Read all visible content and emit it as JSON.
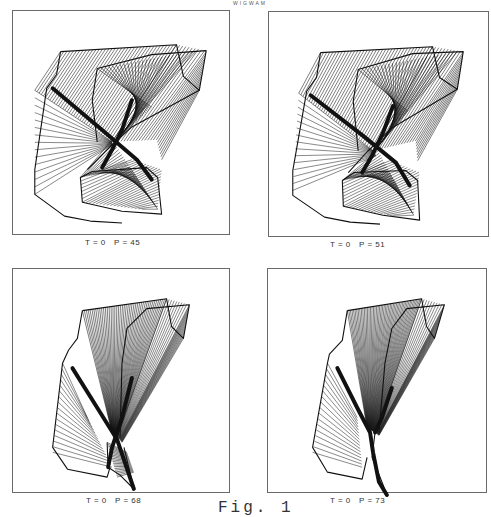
{
  "figure": {
    "header_text": "WIGWAM",
    "label": "Fig. 1",
    "line_color": "#111111",
    "frame_color": "#6a6a6a"
  },
  "panels": [
    {
      "id": "p45",
      "caption": "T = 0   P = 45",
      "T": 0,
      "P": 45,
      "box": {
        "x": 12,
        "y": 10,
        "w": 218,
        "h": 225
      },
      "caption_pos": {
        "x": 85,
        "y": 244
      },
      "surfaces": [
        {
          "a": [
            [
              48,
              41
            ],
            [
              165,
              34
            ]
          ],
          "b": [
            [
              22,
              80
            ],
            [
              100,
              132
            ]
          ],
          "n": 36,
          "w": 0.55
        },
        {
          "a": [
            [
              165,
              34
            ],
            [
              195,
              40
            ],
            [
              188,
              80
            ]
          ],
          "b": [
            [
              100,
              132
            ],
            [
              145,
              130
            ],
            [
              150,
              150
            ]
          ],
          "n": 22,
          "w": 0.55
        },
        {
          "a": [
            [
              85,
              58
            ],
            [
              185,
              40
            ]
          ],
          "b": [
            [
              140,
              97
            ],
            [
              100,
              135
            ]
          ],
          "n": 26,
          "w": 0.55
        },
        {
          "a": [
            [
              22,
              80
            ],
            [
              22,
              185
            ]
          ],
          "b": [
            [
              100,
              132
            ],
            [
              100,
              135
            ]
          ],
          "n": 14,
          "w": 0.5
        },
        {
          "a": [
            [
              68,
              168
            ],
            [
              118,
              158
            ]
          ],
          "b": [
            [
              100,
              130
            ],
            [
              146,
              200
            ]
          ],
          "n": 28,
          "w": 0.55
        },
        {
          "a": [
            [
              68,
              168
            ],
            [
              70,
              193
            ],
            [
              130,
              200
            ]
          ],
          "b": [
            [
              120,
              150
            ],
            [
              150,
              160
            ],
            [
              146,
              200
            ]
          ],
          "n": 24,
          "w": 0.5
        }
      ],
      "outlines": [
        [
          [
            48,
            41
          ],
          [
            165,
            34
          ],
          [
            172,
            66
          ],
          [
            188,
            80
          ],
          [
            195,
            40
          ],
          [
            140,
            44
          ],
          [
            85,
            58
          ],
          [
            80,
            90
          ],
          [
            85,
            132
          ]
        ],
        [
          [
            48,
            41
          ],
          [
            44,
            64
          ],
          [
            34,
            78
          ],
          [
            22,
            160
          ],
          [
            22,
            185
          ],
          [
            52,
            207
          ],
          [
            78,
            212
          ],
          [
            110,
            214
          ]
        ],
        [
          [
            68,
            168
          ],
          [
            80,
            162
          ],
          [
            135,
            158
          ],
          [
            146,
            168
          ],
          [
            150,
            205
          ],
          [
            110,
            202
          ],
          [
            70,
            193
          ],
          [
            68,
            168
          ]
        ],
        [
          [
            188,
            80
          ],
          [
            120,
            117
          ],
          [
            95,
            140
          ],
          [
            75,
            160
          ]
        ]
      ],
      "dark_strokes": [
        [
          [
            40,
            78
          ],
          [
            90,
            120
          ],
          [
            125,
            150
          ],
          [
            140,
            170
          ]
        ],
        [
          [
            120,
            90
          ],
          [
            110,
            120
          ],
          [
            100,
            140
          ],
          [
            90,
            158
          ]
        ]
      ]
    },
    {
      "id": "p51",
      "caption": "T = 0   P = 51",
      "T": 0,
      "P": 51,
      "box": {
        "x": 268,
        "y": 11,
        "w": 221,
        "h": 226
      },
      "caption_pos": {
        "x": 330,
        "y": 246
      },
      "surfaces": [
        {
          "a": [
            [
              52,
              41
            ],
            [
              165,
              35
            ]
          ],
          "b": [
            [
              30,
              82
            ],
            [
              105,
              140
            ]
          ],
          "n": 36,
          "w": 0.55
        },
        {
          "a": [
            [
              165,
              35
            ],
            [
              196,
              40
            ],
            [
              190,
              78
            ]
          ],
          "b": [
            [
              105,
              140
            ],
            [
              148,
              130
            ],
            [
              150,
              150
            ]
          ],
          "n": 22,
          "w": 0.55
        },
        {
          "a": [
            [
              90,
              58
            ],
            [
              190,
              40
            ]
          ],
          "b": [
            [
              140,
              100
            ],
            [
              105,
              142
            ]
          ],
          "n": 26,
          "w": 0.55
        },
        {
          "a": [
            [
              30,
              82
            ],
            [
              24,
              180
            ]
          ],
          "b": [
            [
              105,
              140
            ],
            [
              108,
              145
            ]
          ],
          "n": 14,
          "w": 0.5
        },
        {
          "a": [
            [
              74,
              170
            ],
            [
              120,
              160
            ]
          ],
          "b": [
            [
              110,
              140
            ],
            [
              146,
              205
            ]
          ],
          "n": 28,
          "w": 0.55
        },
        {
          "a": [
            [
              74,
              170
            ],
            [
              75,
              196
            ],
            [
              125,
              206
            ]
          ],
          "b": [
            [
              122,
              150
            ],
            [
              152,
              162
            ],
            [
              146,
              205
            ]
          ],
          "n": 24,
          "w": 0.5
        }
      ],
      "outlines": [
        [
          [
            52,
            41
          ],
          [
            165,
            35
          ],
          [
            172,
            66
          ],
          [
            190,
            78
          ],
          [
            196,
            40
          ],
          [
            145,
            42
          ],
          [
            90,
            58
          ],
          [
            85,
            90
          ],
          [
            90,
            140
          ]
        ],
        [
          [
            52,
            41
          ],
          [
            48,
            66
          ],
          [
            38,
            80
          ],
          [
            24,
            160
          ],
          [
            24,
            185
          ],
          [
            56,
            207
          ],
          [
            82,
            212
          ],
          [
            112,
            214
          ]
        ],
        [
          [
            74,
            170
          ],
          [
            86,
            162
          ],
          [
            138,
            160
          ],
          [
            150,
            170
          ],
          [
            152,
            210
          ],
          [
            115,
            205
          ],
          [
            75,
            196
          ],
          [
            74,
            170
          ]
        ],
        [
          [
            190,
            78
          ],
          [
            124,
            117
          ],
          [
            100,
            140
          ],
          [
            80,
            162
          ]
        ]
      ],
      "dark_strokes": [
        [
          [
            42,
            84
          ],
          [
            95,
            125
          ],
          [
            128,
            152
          ],
          [
            142,
            175
          ]
        ],
        [
          [
            125,
            95
          ],
          [
            115,
            122
          ],
          [
            104,
            145
          ],
          [
            94,
            162
          ]
        ]
      ]
    },
    {
      "id": "p68",
      "caption": "T = 0   P = 68",
      "T": 0,
      "P": 68,
      "box": {
        "x": 12,
        "y": 268,
        "w": 218,
        "h": 225
      },
      "caption_pos": {
        "x": 86,
        "y": 502
      },
      "surfaces": [
        {
          "a": [
            [
              70,
              42
            ],
            [
              155,
              30
            ]
          ],
          "b": [
            [
              100,
              165
            ],
            [
              105,
              170
            ]
          ],
          "n": 44,
          "w": 0.55
        },
        {
          "a": [
            [
              155,
              30
            ],
            [
              178,
              36
            ],
            [
              172,
              70
            ]
          ],
          "b": [
            [
              105,
              170
            ],
            [
              108,
              172
            ],
            [
              110,
              175
            ]
          ],
          "n": 22,
          "w": 0.5
        },
        {
          "a": [
            [
              50,
              95
            ],
            [
              40,
              185
            ]
          ],
          "b": [
            [
              75,
              150
            ],
            [
              100,
              200
            ]
          ],
          "n": 16,
          "w": 0.5
        },
        {
          "a": [
            [
              95,
              175
            ],
            [
              105,
              210
            ]
          ],
          "b": [
            [
              115,
              185
            ],
            [
              122,
              205
            ]
          ],
          "n": 20,
          "w": 0.55
        }
      ],
      "outlines": [
        [
          [
            70,
            42
          ],
          [
            155,
            30
          ],
          [
            160,
            58
          ],
          [
            172,
            70
          ],
          [
            178,
            36
          ],
          [
            135,
            40
          ],
          [
            115,
            60
          ],
          [
            110,
            95
          ],
          [
            108,
            170
          ]
        ],
        [
          [
            70,
            42
          ],
          [
            65,
            70
          ],
          [
            56,
            82
          ],
          [
            50,
            95
          ],
          [
            40,
            180
          ],
          [
            55,
            202
          ],
          [
            95,
            210
          ],
          [
            98,
            200
          ]
        ],
        [
          [
            95,
            175
          ],
          [
            96,
            200
          ],
          [
            108,
            208
          ],
          [
            122,
            222
          ],
          [
            112,
            180
          ]
        ]
      ],
      "dark_strokes": [
        [
          [
            60,
            100
          ],
          [
            85,
            140
          ],
          [
            105,
            172
          ],
          [
            122,
            222
          ]
        ],
        [
          [
            120,
            110
          ],
          [
            110,
            150
          ],
          [
            100,
            180
          ],
          [
            96,
            200
          ]
        ]
      ]
    },
    {
      "id": "p73",
      "caption": "T = 0   P = 73",
      "T": 0,
      "P": 73,
      "box": {
        "x": 267,
        "y": 268,
        "w": 220,
        "h": 225
      },
      "caption_pos": {
        "x": 330,
        "y": 502
      },
      "surfaces": [
        {
          "a": [
            [
              80,
              42
            ],
            [
              155,
              30
            ]
          ],
          "b": [
            [
              100,
              160
            ],
            [
              108,
              165
            ]
          ],
          "n": 48,
          "w": 0.55
        },
        {
          "a": [
            [
              155,
              30
            ],
            [
              178,
              36
            ],
            [
              168,
              70
            ]
          ],
          "b": [
            [
              108,
              165
            ],
            [
              110,
              166
            ],
            [
              112,
              168
            ]
          ],
          "n": 22,
          "w": 0.5
        },
        {
          "a": [
            [
              60,
              95
            ],
            [
              45,
              185
            ]
          ],
          "b": [
            [
              90,
              150
            ],
            [
              95,
              200
            ]
          ],
          "n": 16,
          "w": 0.5
        }
      ],
      "outlines": [
        [
          [
            80,
            42
          ],
          [
            155,
            30
          ],
          [
            160,
            58
          ],
          [
            168,
            70
          ],
          [
            178,
            36
          ],
          [
            140,
            40
          ],
          [
            125,
            60
          ],
          [
            118,
            95
          ],
          [
            112,
            165
          ]
        ],
        [
          [
            80,
            42
          ],
          [
            75,
            72
          ],
          [
            62,
            86
          ],
          [
            60,
            95
          ],
          [
            45,
            180
          ],
          [
            60,
            205
          ],
          [
            95,
            212
          ],
          [
            100,
            190
          ]
        ],
        [
          [
            108,
            165
          ],
          [
            105,
            190
          ],
          [
            115,
            215
          ],
          [
            120,
            228
          ]
        ]
      ],
      "dark_strokes": [
        [
          [
            70,
            100
          ],
          [
            90,
            140
          ],
          [
            103,
            165
          ],
          [
            106,
            185
          ],
          [
            112,
            215
          ],
          [
            120,
            228
          ]
        ],
        [
          [
            125,
            120
          ],
          [
            115,
            150
          ],
          [
            108,
            165
          ]
        ]
      ]
    }
  ]
}
